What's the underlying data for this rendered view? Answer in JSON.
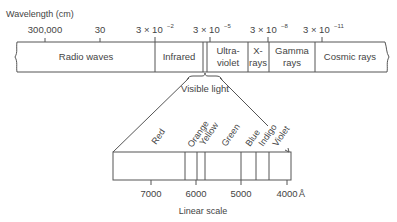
{
  "diagram": {
    "axis_title": "Wavelength (cm)",
    "top_ticks": [
      {
        "label": "300,000",
        "x": 45
      },
      {
        "label": "30",
        "x": 100
      },
      {
        "label": "3 × 10",
        "exp": "−2",
        "x": 155
      },
      {
        "label": "3 × 10",
        "exp": "−5",
        "x": 210
      },
      {
        "label": "3 × 10",
        "exp": "−8",
        "x": 268
      },
      {
        "label": "3 × 10",
        "exp": "−11",
        "x": 322
      }
    ],
    "bands": [
      {
        "name": "radio-waves",
        "lines": [
          "Radio waves"
        ]
      },
      {
        "name": "infrared",
        "lines": [
          "Infrared"
        ]
      },
      {
        "name": "ultraviolet",
        "lines": [
          "Ultra-",
          "violet"
        ]
      },
      {
        "name": "x-rays",
        "lines": [
          "X-",
          "rays"
        ]
      },
      {
        "name": "gamma-rays",
        "lines": [
          "Gamma",
          "rays"
        ]
      },
      {
        "name": "cosmic-rays",
        "lines": [
          "Cosmic rays"
        ]
      }
    ],
    "visible_light_label": "Visible light",
    "colors": [
      "Red",
      "Orange",
      "Yellow",
      "Green",
      "Blue",
      "Indigo",
      "Violet"
    ],
    "bottom_ticks": [
      "7000",
      "6000",
      "5000",
      "4000"
    ],
    "bottom_unit": "Å",
    "bottom_caption": "Linear scale"
  }
}
